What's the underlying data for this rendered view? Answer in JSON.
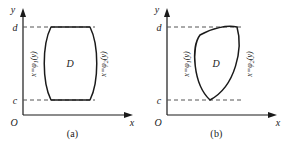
{
  "figure": {
    "name": "type-II-region-diagrams",
    "background_color": "#ffffff",
    "stroke_color": "#1a1a1a",
    "dashed_color": "#555555"
  },
  "panels": [
    {
      "id": "a",
      "caption": "(a)",
      "axes": {
        "y_label": "y",
        "x_label": "x",
        "origin_label": "O"
      },
      "ticks": {
        "upper": "d",
        "lower": "c"
      },
      "region_label": "D",
      "curves": {
        "left": {
          "prefix": "x=",
          "fn": "φ",
          "sub": "1",
          "arg": "(y)"
        },
        "right": {
          "prefix": "x=",
          "fn": "φ",
          "sub": "2",
          "arg": "(y)"
        }
      }
    },
    {
      "id": "b",
      "caption": "(b)",
      "axes": {
        "y_label": "y",
        "x_label": "x",
        "origin_label": "O"
      },
      "ticks": {
        "upper": "d",
        "lower": "c"
      },
      "region_label": "D",
      "curves": {
        "left": {
          "prefix": "x=",
          "fn": "φ",
          "sub": "1",
          "arg": "(y)"
        },
        "right": {
          "prefix": "x=",
          "fn": "φ",
          "sub": "2",
          "arg": "(y)"
        }
      }
    }
  ]
}
